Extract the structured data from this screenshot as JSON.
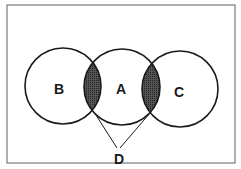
{
  "diagram": {
    "type": "venn",
    "labels": {
      "b": "B",
      "a": "A",
      "c": "C",
      "d": "D"
    },
    "colors": {
      "stroke": "#1a1a1a",
      "shade": "#4a4a4a",
      "frame": "#7a7a7a",
      "background": "#ffffff"
    }
  }
}
